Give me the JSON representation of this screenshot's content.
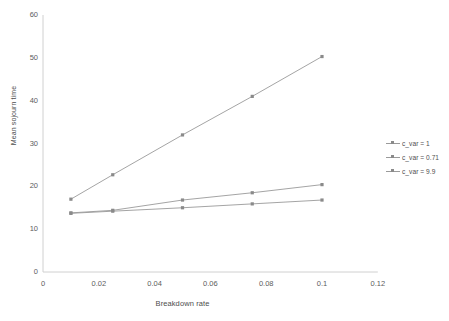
{
  "chart_data": {
    "type": "line",
    "title": "",
    "xlabel": "Breakdown rate",
    "ylabel": "Mean sojourn time",
    "x": [
      0.01,
      0.025,
      0.05,
      0.075,
      0.1
    ],
    "xlim": [
      0,
      0.12
    ],
    "ylim": [
      0,
      60
    ],
    "xticks": [
      "0",
      "0.02",
      "0.04",
      "0.06",
      "0.08",
      "0.1",
      "0.12"
    ],
    "xtick_values": [
      0,
      0.02,
      0.04,
      0.06,
      0.08,
      0.1,
      0.12
    ],
    "yticks": [
      "0",
      "10",
      "20",
      "30",
      "40",
      "50",
      "60"
    ],
    "ytick_values": [
      0,
      10,
      20,
      30,
      40,
      50,
      60
    ],
    "grid": false,
    "legend_position": "right",
    "marker": "square",
    "line_color": "#9a9a9a",
    "marker_color": "#8a8a8a",
    "series": [
      {
        "name": "c_var = 1",
        "values": [
          13.8,
          14.4,
          16.8,
          18.5,
          20.4
        ],
        "color": "#9a9a9a"
      },
      {
        "name": "c_var = 0.71",
        "values": [
          13.7,
          14.2,
          15.0,
          15.9,
          16.8
        ],
        "color": "#9a9a9a"
      },
      {
        "name": "c_var = 9.9",
        "values": [
          17.0,
          22.7,
          32.0,
          41.0,
          50.3
        ],
        "color": "#9a9a9a"
      }
    ]
  },
  "legend": {
    "items": [
      {
        "label": "c_var = 1"
      },
      {
        "label": "c_var = 0.71"
      },
      {
        "label": "c_var = 9.9"
      }
    ]
  },
  "axes": {
    "x_title": "Breakdown rate",
    "y_title": "Mean sojourn time"
  }
}
